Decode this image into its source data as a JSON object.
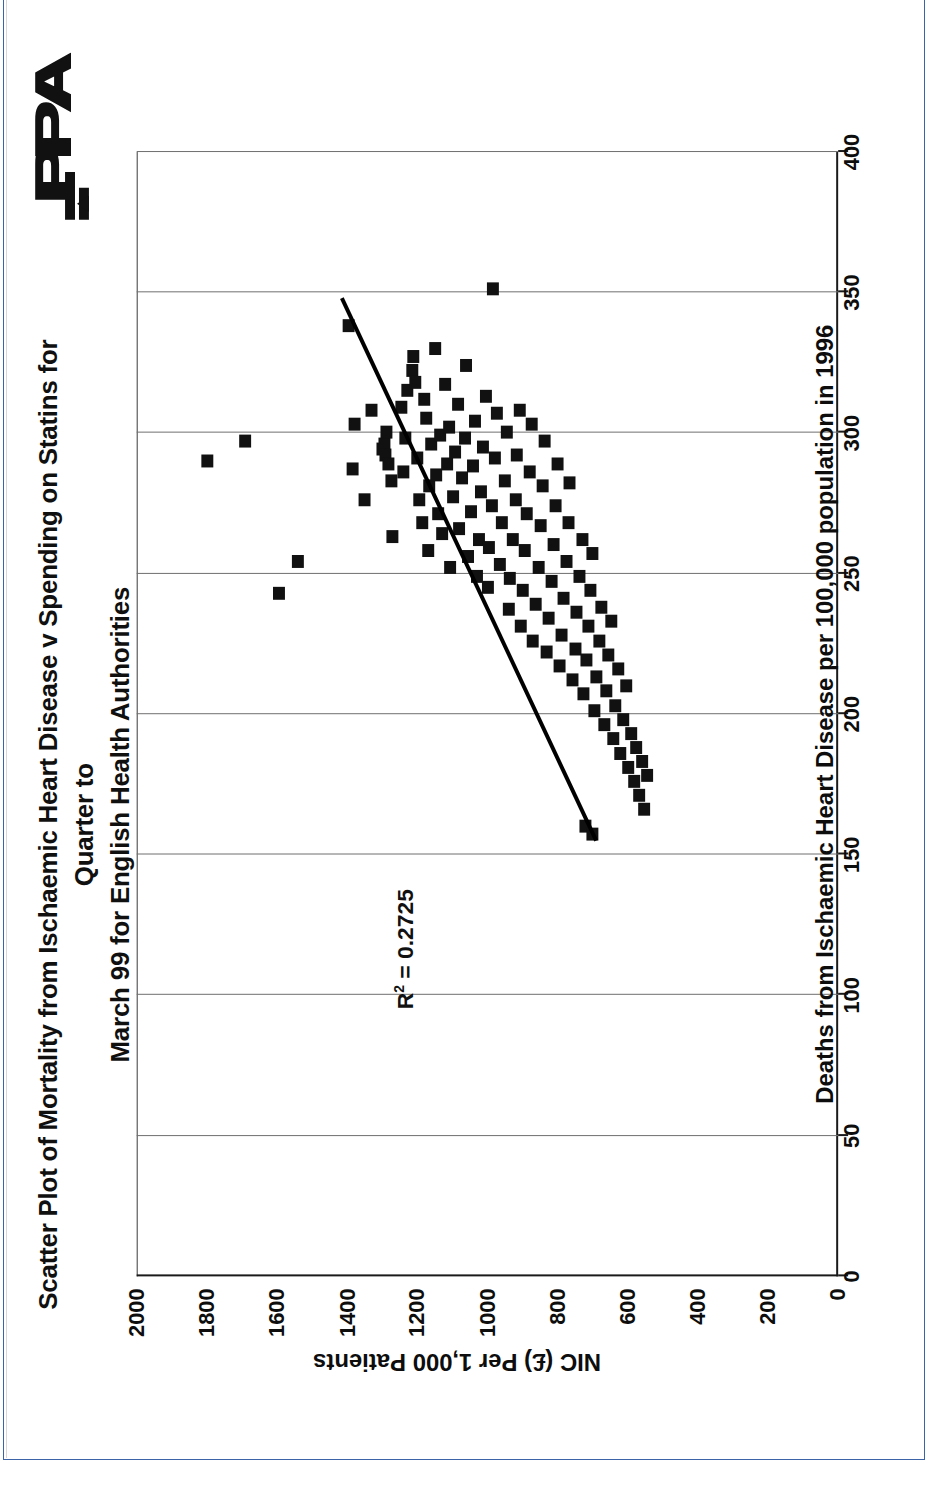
{
  "document": {
    "organization_logo": "ppa-logo",
    "border_color": "#3b63a8"
  },
  "chart_data": {
    "type": "scatter",
    "title": "Scatter Plot of Mortality from Ischaemic Heart Disease v Spending on Statins for Quarter to March 99 for English Health Authorities",
    "title_line_1": "Scatter Plot of Mortality from Ischaemic Heart Disease v Spending on Statins for Quarter to",
    "title_line_2": "March 99 for English Health Authorities",
    "xlabel": "Deaths from Ischaemic Heart Disease per 100,000 population in 1996",
    "ylabel": "NIC (£) Per 1,000 Patients",
    "xlim": [
      0,
      400
    ],
    "ylim": [
      0,
      2000
    ],
    "xticks": [
      "0",
      "50",
      "100",
      "150",
      "200",
      "250",
      "300",
      "350",
      "400"
    ],
    "xtick_values": [
      0,
      50,
      100,
      150,
      200,
      250,
      300,
      350,
      400
    ],
    "yticks": [
      "0",
      "200",
      "400",
      "600",
      "800",
      "1000",
      "1200",
      "1400",
      "1600",
      "1800",
      "2000"
    ],
    "ytick_values": [
      0,
      200,
      400,
      600,
      800,
      1000,
      1200,
      1400,
      1600,
      1800,
      2000
    ],
    "grid": "vertical-only",
    "legend": "none",
    "marker": "filled-square",
    "marker_color": "#111111",
    "annotation": "R² = 0.2725",
    "annotation_r_squared": 0.2725,
    "annotation_x": 95,
    "annotation_y": 1235,
    "trendline": {
      "type": "linear",
      "x_start": 155,
      "y_start": 690,
      "x_end": 348,
      "y_end": 1415,
      "color": "#000000"
    },
    "points": [
      [
        290,
        1800
      ],
      [
        297,
        1690
      ],
      [
        243,
        1595
      ],
      [
        254,
        1540
      ],
      [
        338,
        1395
      ],
      [
        287,
        1385
      ],
      [
        303,
        1380
      ],
      [
        276,
        1350
      ],
      [
        308,
        1330
      ],
      [
        294,
        1300
      ],
      [
        296,
        1295
      ],
      [
        292,
        1290
      ],
      [
        289,
        1282
      ],
      [
        300,
        1288
      ],
      [
        283,
        1275
      ],
      [
        263,
        1270
      ],
      [
        309,
        1245
      ],
      [
        286,
        1240
      ],
      [
        298,
        1235
      ],
      [
        315,
        1228
      ],
      [
        322,
        1215
      ],
      [
        327,
        1212
      ],
      [
        318,
        1205
      ],
      [
        291,
        1200
      ],
      [
        276,
        1195
      ],
      [
        268,
        1185
      ],
      [
        312,
        1180
      ],
      [
        305,
        1175
      ],
      [
        258,
        1170
      ],
      [
        281,
        1165
      ],
      [
        296,
        1160
      ],
      [
        330,
        1150
      ],
      [
        285,
        1145
      ],
      [
        271,
        1140
      ],
      [
        299,
        1135
      ],
      [
        264,
        1128
      ],
      [
        317,
        1120
      ],
      [
        289,
        1115
      ],
      [
        302,
        1110
      ],
      [
        252,
        1105
      ],
      [
        277,
        1098
      ],
      [
        293,
        1092
      ],
      [
        310,
        1085
      ],
      [
        266,
        1080
      ],
      [
        284,
        1072
      ],
      [
        298,
        1065
      ],
      [
        324,
        1060
      ],
      [
        256,
        1055
      ],
      [
        272,
        1048
      ],
      [
        288,
        1042
      ],
      [
        304,
        1035
      ],
      [
        249,
        1030
      ],
      [
        262,
        1025
      ],
      [
        279,
        1018
      ],
      [
        295,
        1012
      ],
      [
        313,
        1005
      ],
      [
        351,
        985
      ],
      [
        245,
        1000
      ],
      [
        259,
        995
      ],
      [
        274,
        988
      ],
      [
        291,
        980
      ],
      [
        307,
        972
      ],
      [
        253,
        965
      ],
      [
        268,
        958
      ],
      [
        283,
        950
      ],
      [
        300,
        945
      ],
      [
        237,
        940
      ],
      [
        248,
        935
      ],
      [
        262,
        928
      ],
      [
        276,
        920
      ],
      [
        292,
        915
      ],
      [
        308,
        908
      ],
      [
        231,
        905
      ],
      [
        244,
        900
      ],
      [
        258,
        895
      ],
      [
        271,
        888
      ],
      [
        286,
        880
      ],
      [
        303,
        875
      ],
      [
        226,
        870
      ],
      [
        239,
        862
      ],
      [
        252,
        855
      ],
      [
        267,
        848
      ],
      [
        281,
        842
      ],
      [
        297,
        838
      ],
      [
        222,
        832
      ],
      [
        234,
        825
      ],
      [
        247,
        818
      ],
      [
        260,
        812
      ],
      [
        274,
        805
      ],
      [
        289,
        800
      ],
      [
        217,
        795
      ],
      [
        228,
        788
      ],
      [
        241,
        782
      ],
      [
        254,
        775
      ],
      [
        268,
        770
      ],
      [
        282,
        765
      ],
      [
        212,
        758
      ],
      [
        223,
        750
      ],
      [
        236,
        745
      ],
      [
        249,
        738
      ],
      [
        262,
        730
      ],
      [
        207,
        725
      ],
      [
        219,
        718
      ],
      [
        231,
        712
      ],
      [
        244,
        705
      ],
      [
        257,
        700
      ],
      [
        201,
        695
      ],
      [
        213,
        688
      ],
      [
        226,
        682
      ],
      [
        238,
        675
      ],
      [
        196,
        668
      ],
      [
        208,
        662
      ],
      [
        221,
        655
      ],
      [
        233,
        648
      ],
      [
        191,
        640
      ],
      [
        203,
        635
      ],
      [
        216,
        628
      ],
      [
        186,
        620
      ],
      [
        198,
        612
      ],
      [
        210,
        605
      ],
      [
        181,
        598
      ],
      [
        193,
        590
      ],
      [
        176,
        582
      ],
      [
        188,
        575
      ],
      [
        171,
        568
      ],
      [
        183,
        560
      ],
      [
        166,
        552
      ],
      [
        178,
        545
      ],
      [
        160,
        720
      ],
      [
        157,
        700
      ]
    ]
  }
}
